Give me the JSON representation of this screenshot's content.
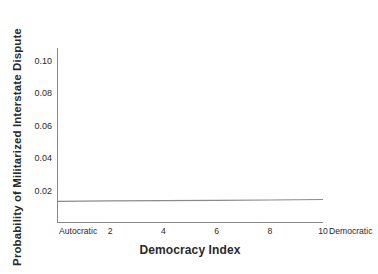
{
  "chart_data": {
    "type": "line",
    "title": "",
    "xlabel": "Democracy Index",
    "ylabel": "Probability of Militarized Interstate Dispute",
    "xlim": [
      0,
      10
    ],
    "ylim": [
      0,
      0.108
    ],
    "grid": false,
    "legend": null,
    "x_tick_labels": [
      "Autocratic",
      "2",
      "4",
      "6",
      "8",
      "10",
      "Democratic"
    ],
    "x_tick_values": [
      0,
      2,
      4,
      6,
      8,
      10,
      10.6
    ],
    "y_tick_labels": [
      "0.10",
      "0.08",
      "0.06",
      "0.04",
      "0.02"
    ],
    "y_tick_values": [
      0.1,
      0.08,
      0.06,
      0.04,
      0.02
    ],
    "series": [
      {
        "name": "Predicted probability",
        "color": "#8a8a8a",
        "x": [
          0,
          2,
          4,
          6,
          8,
          10
        ],
        "values": [
          0.0134,
          0.0136,
          0.0138,
          0.014,
          0.0142,
          0.0145
        ]
      }
    ],
    "annotations": []
  },
  "axes": {
    "y_title": "Probability of Militarized Interstate Dispute",
    "x_title": "Democracy Index",
    "x_left_endpoint_label": "Autocratic",
    "x_right_endpoint_label": "Democratic"
  },
  "colors": {
    "background": "#ffffff",
    "axis": "#8a8a8a",
    "text": "#2a2a2a",
    "line": "#8a8a8a"
  }
}
